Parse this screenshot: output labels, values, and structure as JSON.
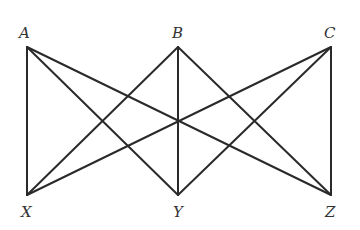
{
  "diagram": {
    "type": "complete-bipartite-graph",
    "vertices": [
      {
        "id": "A",
        "label": "A",
        "x": 27,
        "y": 47,
        "lx": 19,
        "ly": 38
      },
      {
        "id": "B",
        "label": "B",
        "x": 178,
        "y": 47,
        "lx": 172,
        "ly": 38
      },
      {
        "id": "C",
        "label": "C",
        "x": 331,
        "y": 47,
        "lx": 324,
        "ly": 38
      },
      {
        "id": "X",
        "label": "X",
        "x": 27,
        "y": 195,
        "lx": 21,
        "ly": 217
      },
      {
        "id": "Y",
        "label": "Y",
        "x": 178,
        "y": 195,
        "lx": 173,
        "ly": 217
      },
      {
        "id": "Z",
        "label": "Z",
        "x": 331,
        "y": 195,
        "lx": 325,
        "ly": 217
      }
    ],
    "edges": [
      [
        "A",
        "X"
      ],
      [
        "A",
        "Y"
      ],
      [
        "A",
        "Z"
      ],
      [
        "B",
        "X"
      ],
      [
        "B",
        "Y"
      ],
      [
        "B",
        "Z"
      ],
      [
        "C",
        "X"
      ],
      [
        "C",
        "Y"
      ],
      [
        "C",
        "Z"
      ]
    ],
    "stroke_color": "#2a2a2a",
    "label_color": "#333333"
  }
}
